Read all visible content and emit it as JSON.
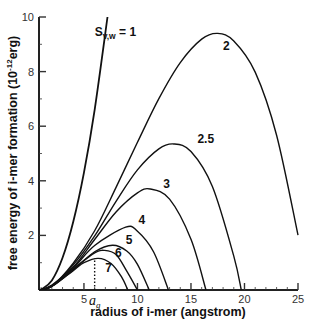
{
  "chart_data": {
    "type": "line",
    "title": "",
    "xlabel": "radius of i-mer (angstrom)",
    "ylabel": "free energy of i-mer formation (10^-12 erg)",
    "ylabel_parts": {
      "main": "free energy of i-mer formation (",
      "unit_base": "10",
      "unit_exp": "-12",
      "unit_rest": "erg)"
    },
    "xlim": [
      0.8,
      25
    ],
    "ylim": [
      0,
      10
    ],
    "x_ticks": [
      5,
      10,
      15,
      20,
      25
    ],
    "x_tick_labels": [
      "5",
      "10",
      "15",
      "20",
      "25"
    ],
    "y_ticks": [
      2,
      4,
      6,
      8,
      10
    ],
    "y_tick_labels": [
      "2",
      "4",
      "6",
      "8",
      "10"
    ],
    "grid": false,
    "legend": "inline labels",
    "series": [
      {
        "name": "S_v,w = 1",
        "label": "1",
        "points": [
          [
            0.8,
            0
          ],
          [
            1,
            0.01
          ],
          [
            2,
            0.35
          ],
          [
            3,
            1.18
          ],
          [
            4,
            2.5
          ],
          [
            5,
            4.3
          ],
          [
            6,
            6.6
          ],
          [
            7.2,
            10
          ]
        ]
      },
      {
        "name": "S_v,w = 2",
        "label": "2",
        "points": [
          [
            0.8,
            0
          ],
          [
            2,
            0.14
          ],
          [
            4,
            0.98
          ],
          [
            6,
            2.17
          ],
          [
            8,
            3.76
          ],
          [
            10,
            5.41
          ],
          [
            12,
            7.01
          ],
          [
            14,
            8.33
          ],
          [
            16,
            9.19
          ],
          [
            17.5,
            9.4
          ],
          [
            19,
            9.12
          ],
          [
            21,
            7.98
          ],
          [
            23,
            5.67
          ],
          [
            25,
            2.01
          ]
        ]
      },
      {
        "name": "S_v,w = 2.5",
        "label": "2.5",
        "points": [
          [
            0.8,
            0
          ],
          [
            2,
            0.15
          ],
          [
            4,
            0.92
          ],
          [
            6,
            1.98
          ],
          [
            8,
            3.25
          ],
          [
            10,
            4.4
          ],
          [
            12,
            5.17
          ],
          [
            13.4,
            5.35
          ],
          [
            15,
            5.07
          ],
          [
            17,
            3.79
          ],
          [
            19,
            1.24
          ],
          [
            19.7,
            0
          ]
        ]
      },
      {
        "name": "S_v,w = 3",
        "label": "3",
        "points": [
          [
            0.8,
            0
          ],
          [
            2,
            0.18
          ],
          [
            4,
            0.84
          ],
          [
            6,
            1.85
          ],
          [
            8,
            2.86
          ],
          [
            10,
            3.56
          ],
          [
            11.2,
            3.7
          ],
          [
            13,
            3.33
          ],
          [
            15,
            1.86
          ],
          [
            16.4,
            0
          ]
        ]
      },
      {
        "name": "S_v,w = 4",
        "label": "4",
        "points": [
          [
            0.8,
            0
          ],
          [
            2,
            0.14
          ],
          [
            4,
            0.8
          ],
          [
            6,
            1.63
          ],
          [
            8.9,
            2.3
          ],
          [
            10,
            2.15
          ],
          [
            11.5,
            1.4
          ],
          [
            12.9,
            0
          ]
        ]
      },
      {
        "name": "S_v,w = 5",
        "label": "5",
        "points": [
          [
            0.8,
            0
          ],
          [
            2,
            0.13
          ],
          [
            4,
            0.74
          ],
          [
            6,
            1.4
          ],
          [
            7.67,
            1.64
          ],
          [
            9,
            1.43
          ],
          [
            10,
            0.94
          ],
          [
            11.1,
            0
          ]
        ]
      },
      {
        "name": "S_v,w = 6",
        "label": "6",
        "points": [
          [
            0.8,
            0
          ],
          [
            2,
            0.145
          ],
          [
            4,
            0.77
          ],
          [
            6,
            1.36
          ],
          [
            6.93,
            1.45
          ],
          [
            8,
            1.3
          ],
          [
            9,
            0.69
          ],
          [
            10,
            0
          ]
        ]
      },
      {
        "name": "S_v,w = 7",
        "label": "7",
        "points": [
          [
            0.8,
            0
          ],
          [
            2,
            0.14
          ],
          [
            4,
            0.71
          ],
          [
            5,
            1.0
          ],
          [
            6.33,
            1.16
          ],
          [
            7.5,
            0.98
          ],
          [
            8.5,
            0.49
          ],
          [
            9.1,
            0
          ]
        ]
      }
    ],
    "annotations": [
      {
        "text": "S_v,w = 1",
        "text_parts": {
          "base": "S",
          "sub": "v,w",
          "rest": " = 1"
        },
        "x": 6.0,
        "y": 9.3
      },
      {
        "text": "2",
        "x": 18.0,
        "y": 8.8
      },
      {
        "text": "2.5",
        "x": 15.6,
        "y": 5.4
      },
      {
        "text": "3",
        "x": 12.4,
        "y": 3.75
      },
      {
        "text": "4",
        "x": 10.1,
        "y": 2.4
      },
      {
        "text": "5",
        "x": 8.9,
        "y": 1.7
      },
      {
        "text": "6",
        "x": 7.9,
        "y": 1.2
      },
      {
        "text": "7",
        "x": 7.0,
        "y": 0.65
      }
    ],
    "marker": {
      "symbol": "a_g",
      "base": "a",
      "sub": "g",
      "x": 6.0,
      "y": 1.16,
      "style": "dotted vertical line"
    }
  }
}
